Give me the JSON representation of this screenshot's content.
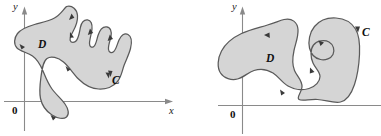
{
  "figure": {
    "type": "math-diagram",
    "background_color": "#ffffff",
    "region_fill_color": "#d5d5d5",
    "curve_stroke_color": "#5a5a5a",
    "axis_color": "#8a8a8a",
    "panels": [
      {
        "id": "left-panel",
        "axes": {
          "y_label": "y",
          "x_label": "x",
          "origin_label": "0",
          "x_axis_has_arrow": true,
          "y_axis_has_arrow": true
        },
        "region_label": "D",
        "curve_label": "C",
        "orientation": "counterclockwise",
        "direction_arrow_count": 8,
        "shape_description": "multi-lobed blob with three finger-like protrusions at top and a pendant lobe crossing the x-axis at lower left"
      },
      {
        "id": "right-panel",
        "axes": {
          "y_label": "y",
          "x_label": "",
          "origin_label": "0",
          "x_axis_has_arrow": false,
          "y_axis_has_arrow": true
        },
        "region_label": "D",
        "curve_label": "C",
        "orientation": "counterclockwise",
        "direction_arrow_count": 4,
        "shape_description": "two-lobed blob with a deep S-shaped interior notch between the lobes, label C at upper right on the boundary"
      }
    ]
  }
}
